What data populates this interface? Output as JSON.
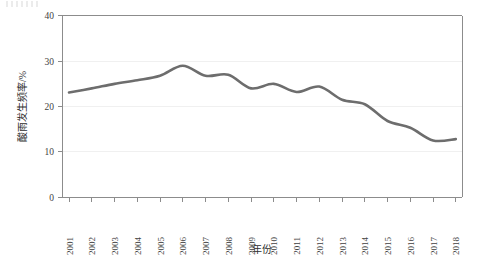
{
  "chart_data": {
    "type": "line",
    "title": "",
    "xlabel": "年份",
    "ylabel": "酸雨发生频率/%",
    "categories": [
      "2001",
      "2002",
      "2003",
      "2004",
      "2005",
      "2006",
      "2007",
      "2008",
      "2009",
      "2010",
      "2011",
      "2012",
      "2013",
      "2014",
      "2015",
      "2016",
      "2017",
      "2018"
    ],
    "x": [
      2001,
      2002,
      2003,
      2004,
      2005,
      2006,
      2007,
      2008,
      2009,
      2010,
      2011,
      2012,
      2013,
      2014,
      2015,
      2016,
      2017,
      2018
    ],
    "series": [
      {
        "name": "酸雨发生频率",
        "values": [
          23.1,
          24.0,
          25.0,
          25.8,
          26.8,
          29.0,
          26.8,
          27.0,
          24.0,
          25.0,
          23.2,
          24.4,
          21.5,
          20.5,
          16.8,
          15.3,
          12.5,
          12.8
        ],
        "color": "#6d6d6d"
      }
    ],
    "ylim": [
      0,
      40
    ],
    "yticks": [
      0,
      10,
      20,
      30,
      40
    ],
    "ytick_labels": [
      "0",
      "10",
      "20",
      "30",
      "40"
    ],
    "xlim": [
      2001,
      2018
    ],
    "grid": "horizontal-light",
    "legend": "none",
    "axis_color": "#8c8c8c",
    "background": "#ffffff"
  }
}
